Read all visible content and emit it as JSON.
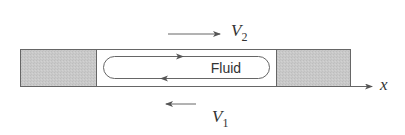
{
  "diagram": {
    "title": "",
    "labels": {
      "fluid": "Fluid",
      "top_velocity_symbol": "V",
      "top_velocity_subscript": "2",
      "bottom_velocity_symbol": "V",
      "bottom_velocity_subscript": "1",
      "axis": "x"
    },
    "elements": {
      "left_block": {
        "shade": "gray",
        "color": "#c8c8c8"
      },
      "right_block": {
        "shade": "gray",
        "color": "#c8c8c8"
      },
      "channel": {
        "fill": "#ffffff"
      },
      "top_velocity_arrow": {
        "direction": "right"
      },
      "bottom_velocity_arrow": {
        "direction": "left"
      },
      "circulation_loop": {
        "upper_flow": "right",
        "lower_flow": "left"
      },
      "x_axis_arrow": {
        "direction": "right"
      }
    },
    "colors": {
      "stroke": "#555555",
      "block_fill": "#c8c8c8",
      "background": "#ffffff",
      "text": "#333333"
    }
  }
}
